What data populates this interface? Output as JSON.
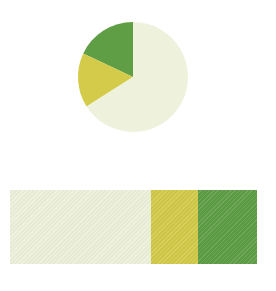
{
  "chart_data": [
    {
      "type": "pie",
      "title": "",
      "categories": [
        "Dark green",
        "Yellow",
        "Light cream"
      ],
      "values": [
        18,
        16,
        66
      ],
      "colors": [
        "#5f9e45",
        "#d4cb4a",
        "#eef2dc"
      ],
      "legend": "none"
    },
    {
      "type": "bar",
      "orientation": "horizontal-stacked",
      "title": "",
      "categories": [
        "Light cream",
        "Yellow",
        "Dark green"
      ],
      "values": [
        57,
        19,
        24
      ],
      "colors": [
        "#eef2dc",
        "#d4cb4a",
        "#5f9e45"
      ],
      "legend": "none"
    }
  ]
}
